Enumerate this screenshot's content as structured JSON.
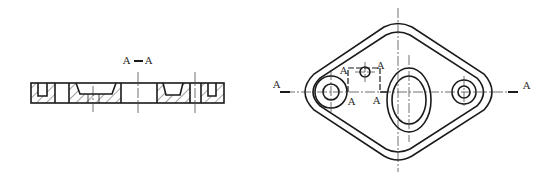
{
  "drawing": {
    "section_view": {
      "title": "A — A",
      "title_left": "A",
      "title_dash": "—",
      "title_right": "A"
    },
    "plan_view": {
      "cut_labels": {
        "left_end": "A",
        "right_end": "A",
        "step_top_left": "A",
        "step_top_right": "A",
        "step_bottom_left": "A",
        "step_bottom_right": "A"
      }
    },
    "colors": {
      "line": "#1a1a1a",
      "background": "#ffffff"
    }
  }
}
